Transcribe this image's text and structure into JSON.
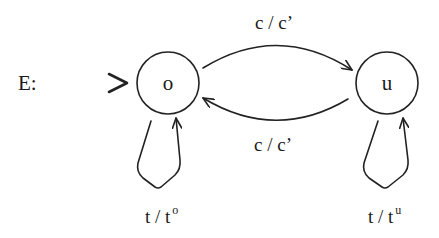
{
  "automaton": {
    "name": "E:",
    "initial_marker": ">",
    "states": [
      {
        "id": "o",
        "label": "o",
        "initial": true
      },
      {
        "id": "u",
        "label": "u",
        "initial": false
      }
    ],
    "transitions": [
      {
        "from": "o",
        "to": "u",
        "input": "c",
        "sep": "/",
        "output": "c’",
        "label": "c / c’"
      },
      {
        "from": "u",
        "to": "o",
        "input": "c",
        "sep": "/",
        "output": "c’",
        "label": "c / c’"
      },
      {
        "from": "o",
        "to": "o",
        "input": "t",
        "sep": "/",
        "output_base": "t",
        "output_sup": "o"
      },
      {
        "from": "u",
        "to": "u",
        "input": "t",
        "sep": "/",
        "output_base": "t",
        "output_sup": "u"
      }
    ]
  }
}
